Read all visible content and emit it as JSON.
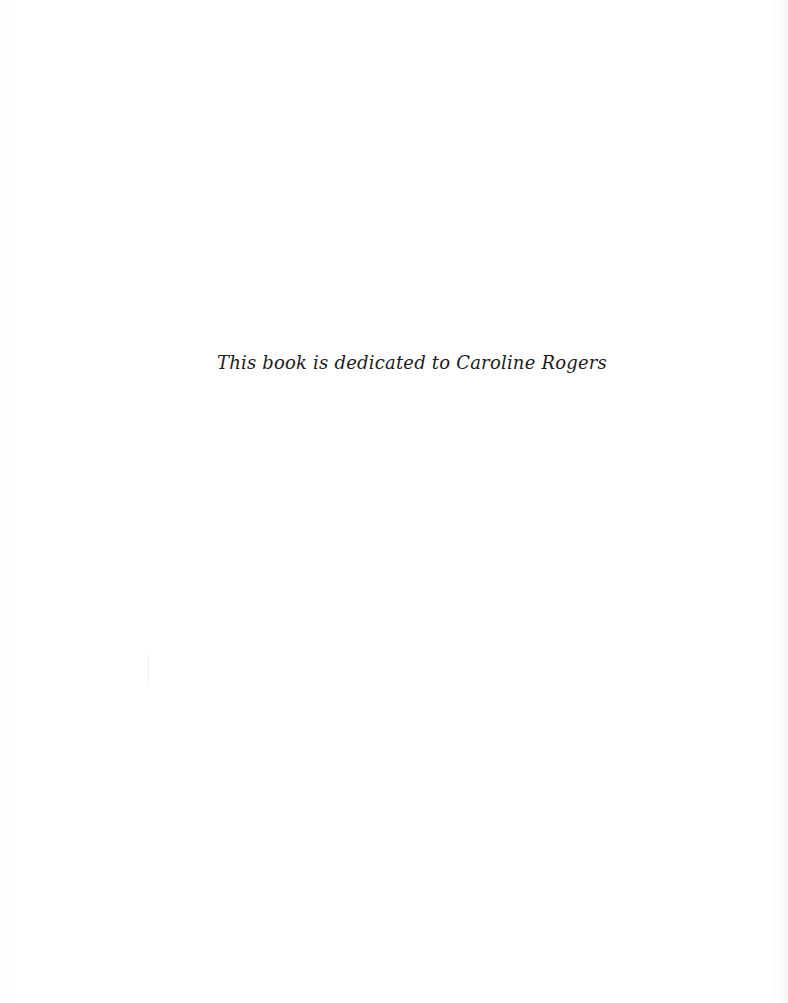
{
  "page": {
    "dedication_text": "This book is dedicated to Caroline Rogers"
  }
}
